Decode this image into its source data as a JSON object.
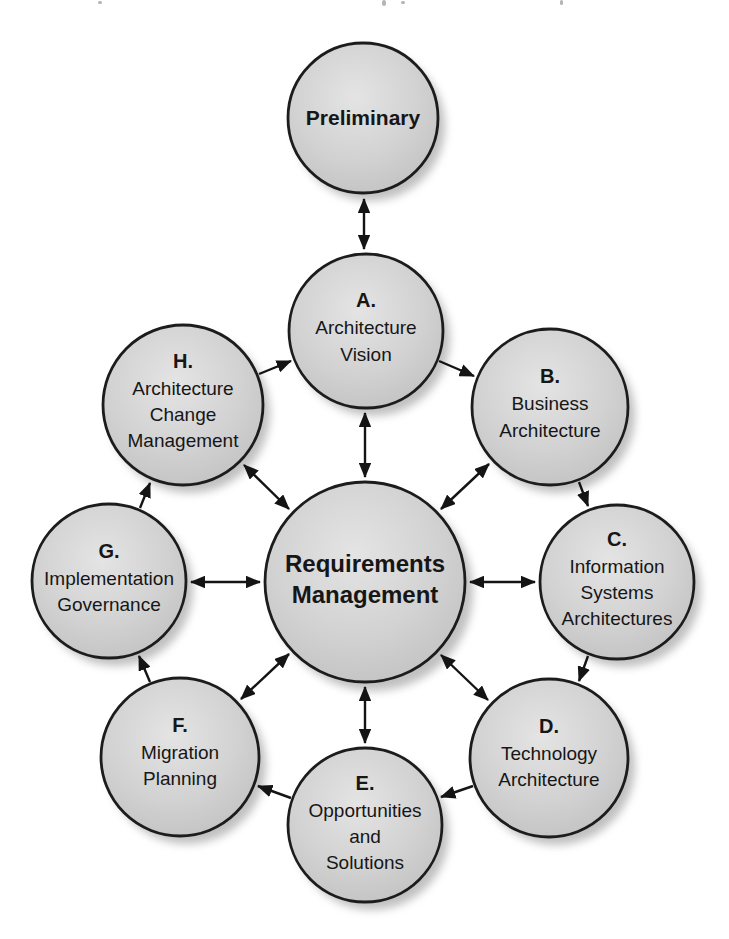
{
  "nodes": {
    "preliminary": {
      "label": "Preliminary"
    },
    "a": {
      "letter": "A.",
      "lines": [
        "Architecture",
        "Vision"
      ]
    },
    "b": {
      "letter": "B.",
      "lines": [
        "Business",
        "Architecture"
      ]
    },
    "c": {
      "letter": "C.",
      "lines": [
        "Information",
        "Systems",
        "Architectures"
      ]
    },
    "d": {
      "letter": "D.",
      "lines": [
        "Technology",
        "Architecture"
      ]
    },
    "e": {
      "letter": "E.",
      "lines": [
        "Opportunities",
        "and",
        "Solutions"
      ]
    },
    "f": {
      "letter": "F.",
      "lines": [
        "Migration",
        "Planning"
      ]
    },
    "g": {
      "letter": "G.",
      "lines": [
        "Implementation",
        "Governance"
      ]
    },
    "h": {
      "letter": "H.",
      "lines": [
        "Architecture",
        "Change",
        "Management"
      ]
    },
    "center": {
      "lines": [
        "Requirements",
        "Management"
      ]
    }
  },
  "edges": [
    {
      "from": "preliminary",
      "to": "a",
      "style": "double"
    },
    {
      "from": "center",
      "to": "a",
      "style": "double"
    },
    {
      "from": "center",
      "to": "b",
      "style": "double"
    },
    {
      "from": "center",
      "to": "c",
      "style": "double"
    },
    {
      "from": "center",
      "to": "d",
      "style": "double"
    },
    {
      "from": "center",
      "to": "e",
      "style": "double"
    },
    {
      "from": "center",
      "to": "f",
      "style": "double"
    },
    {
      "from": "center",
      "to": "g",
      "style": "double"
    },
    {
      "from": "center",
      "to": "h",
      "style": "double"
    },
    {
      "from": "a",
      "to": "b",
      "style": "single"
    },
    {
      "from": "b",
      "to": "c",
      "style": "single"
    },
    {
      "from": "c",
      "to": "d",
      "style": "single"
    },
    {
      "from": "d",
      "to": "e",
      "style": "single"
    },
    {
      "from": "e",
      "to": "f",
      "style": "single"
    },
    {
      "from": "f",
      "to": "g",
      "style": "single"
    },
    {
      "from": "g",
      "to": "h",
      "style": "single"
    },
    {
      "from": "h",
      "to": "a",
      "style": "single"
    }
  ],
  "colors": {
    "background": "#ffffff",
    "circle_fill": "#d2d2d2",
    "circle_fill_highlight": "#e4e4e4",
    "circle_fill_edge": "#bfbfbf",
    "circle_border": "#1c1c1c",
    "arrow": "#141414",
    "text": "#161616",
    "shadow": "#9a9a9a"
  }
}
